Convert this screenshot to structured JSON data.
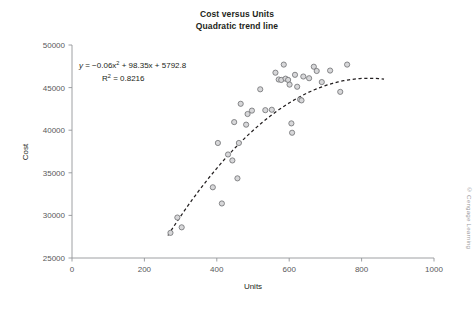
{
  "figure": {
    "title_lines": [
      "Cost versus Units",
      "Quadratic trend line"
    ],
    "credit": "© Cengage Learning"
  },
  "annotation": {
    "equation_prefix": "y",
    "equation_body": " = −0.06x",
    "equation_sup1": "2",
    "equation_rest": " + 98.35x + 5792.8",
    "r2_label": "R",
    "r2_sup": "2",
    "r2_value": " = 0.8216"
  },
  "chart_data": {
    "type": "scatter",
    "title": "Cost versus Units\nQuadratic trend line",
    "xlabel": "Units",
    "ylabel": "Cost",
    "xlim": [
      0,
      1000
    ],
    "ylim": [
      25000,
      50000
    ],
    "xticks": [
      0,
      200,
      400,
      600,
      800,
      1000
    ],
    "yticks": [
      25000,
      30000,
      35000,
      40000,
      45000,
      50000
    ],
    "xtick_labels": [
      "0",
      "200",
      "400",
      "600",
      "800",
      "1000"
    ],
    "ytick_labels": [
      "25000",
      "30000",
      "35000",
      "40000",
      "45000",
      "50000"
    ],
    "grid": false,
    "legend": "none",
    "marker": "open-circle-gray",
    "series": [
      {
        "name": "Cost observations",
        "points": [
          [
            272,
            27950
          ],
          [
            291,
            29750
          ],
          [
            303,
            28600
          ],
          [
            389,
            33300
          ],
          [
            403,
            38500
          ],
          [
            414,
            31400
          ],
          [
            431,
            37150
          ],
          [
            443,
            36450
          ],
          [
            448,
            40950
          ],
          [
            457,
            34350
          ],
          [
            461,
            38500
          ],
          [
            466,
            43100
          ],
          [
            481,
            40650
          ],
          [
            485,
            41900
          ],
          [
            497,
            42300
          ],
          [
            520,
            44800
          ],
          [
            534,
            42350
          ],
          [
            552,
            42400
          ],
          [
            562,
            46750
          ],
          [
            571,
            45950
          ],
          [
            578,
            45900
          ],
          [
            585,
            47700
          ],
          [
            590,
            46050
          ],
          [
            597,
            45900
          ],
          [
            601,
            45350
          ],
          [
            606,
            40800
          ],
          [
            608,
            39700
          ],
          [
            616,
            46500
          ],
          [
            622,
            45100
          ],
          [
            630,
            43600
          ],
          [
            634,
            43500
          ],
          [
            639,
            46300
          ],
          [
            655,
            46100
          ],
          [
            668,
            47450
          ],
          [
            676,
            46950
          ],
          [
            690,
            45650
          ],
          [
            713,
            47000
          ],
          [
            741,
            44500
          ],
          [
            760,
            47700
          ]
        ]
      }
    ],
    "trendline": {
      "type": "quadratic",
      "equation": "y = −0.06x² + 98.35x + 5792.8",
      "coefficients": {
        "a": -0.06,
        "b": 98.35,
        "c": 5792.8
      },
      "r_squared": 0.8216,
      "x_range": [
        265,
        862
      ],
      "style": "dashed-black"
    }
  }
}
